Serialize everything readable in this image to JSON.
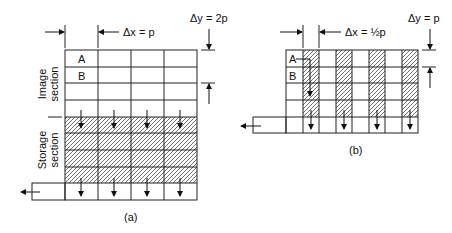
{
  "figure_a": {
    "caption": "(a)",
    "dx_label": "Δx = p",
    "dy_label": "Δy = 2p",
    "cell_labels": [
      "A",
      "B"
    ],
    "section_labels": {
      "image_line1": "Image",
      "image_line2": "section",
      "storage_line1": "Storage",
      "storage_line2": "section"
    },
    "columns": 4,
    "image_rows": 4,
    "storage_rows": 4,
    "readout_rows": 1
  },
  "figure_b": {
    "caption": "(b)",
    "dx_label": "Δx = ½p",
    "dy_label": "Δy = p",
    "cell_labels": [
      "A",
      "B"
    ],
    "columns": 8,
    "rows": 4,
    "readout_rows": 1,
    "hatched_columns": [
      1,
      3,
      5,
      7
    ]
  },
  "colors": {
    "line": "#222222",
    "background": "#ffffff"
  }
}
